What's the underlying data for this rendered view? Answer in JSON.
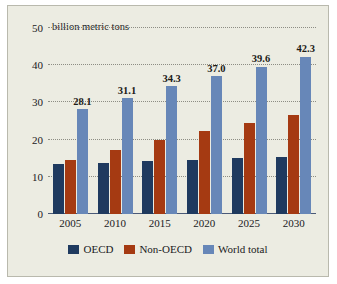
{
  "chart_data": {
    "type": "bar",
    "title": "",
    "subtitle": "",
    "axis_unit_label": "billion metric tons",
    "xlabel": "",
    "ylabel": "",
    "ylim": [
      0,
      50
    ],
    "yticks": [
      0,
      10,
      20,
      30,
      40,
      50
    ],
    "ytick_labels": [
      "0",
      "10",
      "20",
      "30",
      "40",
      "50"
    ],
    "grid": true,
    "grid_axis": "y",
    "legend_position": "bottom",
    "categories": [
      "2005",
      "2010",
      "2015",
      "2020",
      "2025",
      "2030"
    ],
    "series": [
      {
        "name": "OECD",
        "color": "#1f3a5f",
        "values": [
          13.5,
          13.8,
          14.2,
          14.6,
          15.0,
          15.2
        ],
        "labels": [
          "",
          "",
          "",
          "",
          "",
          ""
        ]
      },
      {
        "name": "Non-OECD",
        "color": "#a53a12",
        "values": [
          14.6,
          17.3,
          19.9,
          22.2,
          24.5,
          26.5
        ],
        "labels": [
          "",
          "",
          "",
          "",
          "",
          ""
        ]
      },
      {
        "name": "World total",
        "color": "#6787b8",
        "values": [
          28.1,
          31.1,
          34.3,
          37.0,
          39.6,
          42.3
        ],
        "labels": [
          "28.1",
          "31.1",
          "34.3",
          "37.0",
          "39.6",
          "42.3"
        ]
      }
    ]
  },
  "legend": {
    "items": [
      {
        "label": "OECD",
        "color": "#1f3a5f"
      },
      {
        "label": "Non-OECD",
        "color": "#a53a12"
      },
      {
        "label": "World total",
        "color": "#6787b8"
      }
    ]
  },
  "colors": {
    "background": "#ecece2",
    "border": "#b9b9ad",
    "axis": "#4a5a78",
    "grid": "#8d8d84",
    "text": "#20201c",
    "series_oecd": "#1f3a5f",
    "series_non_oecd": "#a53a12",
    "series_world_total": "#6787b8"
  }
}
